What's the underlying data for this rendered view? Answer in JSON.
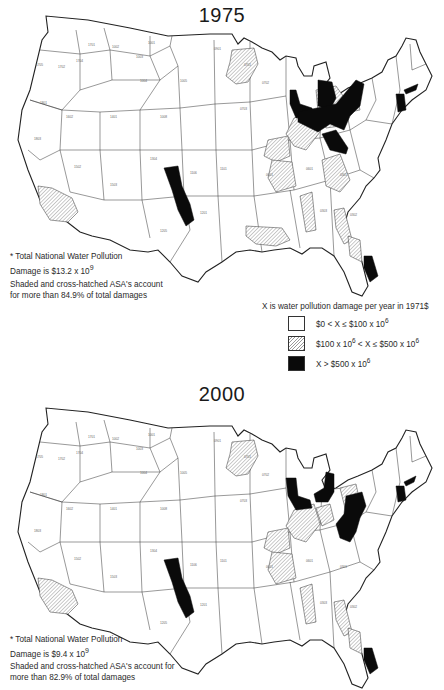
{
  "figure": {
    "legend": {
      "title": "X is water pollution damage per year in 1971$",
      "items": [
        {
          "swatch": "white",
          "label": "$0 < X ≤ $100 x 10",
          "exp": "6",
          "suffix": ""
        },
        {
          "swatch": "hatch",
          "label": "$100 x 10",
          "exp": "6",
          "suffix": " < X ≤ $500 x 10",
          "exp2": "6"
        },
        {
          "swatch": "black",
          "label": "X > $500 x 10",
          "exp": "6",
          "suffix": ""
        }
      ]
    },
    "maps": [
      {
        "year": "1975",
        "total_note_line1": "* Total National Water Pollution",
        "total_note_line2": "Damage is $13.2 x 10",
        "total_exp": "9",
        "share_note_line1": "Shaded and cross-hatched ASA's account",
        "share_note_line2": "for more than 84.9% of total damages"
      },
      {
        "year": "2000",
        "total_note_line1": "* Total National Water Pollution",
        "total_note_line2": "Damage is $9.4 x 10",
        "total_exp": "9",
        "share_note_line1": "Shaded and cross-hatched ASA's account for",
        "share_note_line2": "more than 82.9% of total damages"
      }
    ],
    "region_labels_sample": [
      "1705",
      "1702",
      "1701",
      "1704",
      "1703",
      "1801",
      "1802",
      "1803",
      "1804",
      "1805",
      "1806",
      "1807",
      "1601",
      "1602",
      "1603",
      "1501",
      "1502",
      "1503",
      "1401",
      "1402",
      "1403",
      "1002",
      "1001",
      "1003",
      "1004",
      "1005",
      "1006",
      "1008",
      "1010",
      "0901",
      "0701",
      "0702",
      "0703",
      "0704",
      "0705",
      "0401",
      "0402",
      "0403",
      "0404",
      "0405",
      "0406",
      "0407",
      "0408",
      "0501",
      "0502",
      "0503",
      "0504",
      "0505",
      "0506",
      "0507",
      "0601",
      "0801",
      "0802",
      "0803",
      "1101",
      "1102",
      "1103",
      "1104",
      "1105",
      "1106",
      "1107",
      "1201",
      "1202",
      "1203",
      "1204",
      "1205",
      "1301",
      "1302",
      "1303",
      "1304",
      "0301",
      "0302",
      "0303",
      "0304",
      "0305",
      "0306",
      "0307",
      "0201",
      "0202",
      "0203",
      "0204",
      "0205",
      "0101",
      "0102",
      "0103",
      "0104",
      "0105",
      "0106"
    ],
    "colors": {
      "outline": "#222222",
      "hatch": "#999999",
      "severe": "#0a0a0a",
      "background": "#ffffff"
    }
  }
}
